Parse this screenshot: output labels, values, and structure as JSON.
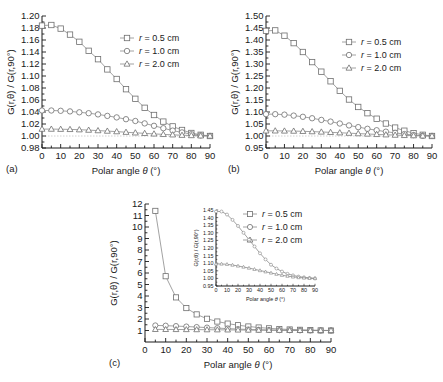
{
  "figure": {
    "panels": [
      {
        "id": "a",
        "label": "(a)",
        "xlabel_main": "Polar angle",
        "xlabel_sym": "θ",
        "xlabel_unit": "(°)",
        "ylabel": "G(r,θ) / G(r,90°)",
        "xticks": [
          0,
          10,
          20,
          30,
          40,
          50,
          60,
          70,
          80,
          90
        ],
        "yticks": [
          "0.98",
          "1.00",
          "1.02",
          "1.04",
          "1.06",
          "1.08",
          "1.10",
          "1.12",
          "1.14",
          "1.16",
          "1.18",
          "1.20"
        ],
        "legend": [
          {
            "marker": "square",
            "label": "r = 0.5 cm"
          },
          {
            "marker": "circle",
            "label": "r = 1.0 cm"
          },
          {
            "marker": "triangle",
            "label": "r = 2.0 cm"
          }
        ]
      },
      {
        "id": "b",
        "label": "(b)",
        "xlabel_main": "Polar angle",
        "xlabel_sym": "θ",
        "xlabel_unit": "(°)",
        "ylabel": "G(r,θ) / G(r,90°)",
        "xticks": [
          0,
          10,
          20,
          30,
          40,
          50,
          60,
          70,
          80,
          90
        ],
        "yticks": [
          "0.95",
          "1.00",
          "1.05",
          "1.10",
          "1.15",
          "1.20",
          "1.25",
          "1.30",
          "1.35",
          "1.40",
          "1.45",
          "1.50"
        ],
        "legend": [
          {
            "marker": "square",
            "label": "r = 0.5 cm"
          },
          {
            "marker": "circle",
            "label": "r = 1.0 cm"
          },
          {
            "marker": "triangle",
            "label": "r = 2.0 cm"
          }
        ]
      },
      {
        "id": "c",
        "label": "(c)",
        "xlabel_main": "Polar angle",
        "xlabel_sym": "θ",
        "xlabel_unit": "(°)",
        "ylabel": "G(r,θ) / G(r,90°)",
        "xticks": [
          0,
          10,
          20,
          30,
          40,
          50,
          60,
          70,
          80,
          90
        ],
        "yticks": [
          "1",
          "2",
          "3",
          "4",
          "5",
          "6",
          "7",
          "8",
          "9",
          "10",
          "11",
          "12"
        ],
        "legend": [
          {
            "marker": "square",
            "label": "r = 0.5 cm"
          },
          {
            "marker": "circle",
            "label": "r = 1.0 cm"
          },
          {
            "marker": "triangle",
            "label": "r = 2.0 cm"
          }
        ],
        "inset": {
          "xlabel_main": "Polar angle",
          "xlabel_sym": "θ",
          "xlabel_unit": "(°)",
          "ylabel": "G(r,θ) / G(r,90°)",
          "xticks": [
            0,
            10,
            20,
            30,
            40,
            50,
            60,
            70,
            80,
            90
          ],
          "yticks": [
            "0.95",
            "1.00",
            "1.05",
            "1.10",
            "1.15",
            "1.20",
            "1.25",
            "1.30",
            "1.35",
            "1.40",
            "1.45"
          ]
        }
      }
    ]
  },
  "chart_data": [
    {
      "type": "line",
      "panel": "a",
      "title": "",
      "xlabel": "Polar angle θ (°)",
      "ylabel": "G(r,θ) / G(r,90°)",
      "xlim": [
        0,
        90
      ],
      "ylim": [
        0.98,
        1.2
      ],
      "grid": false,
      "legend_position": "upper-right",
      "x": [
        0,
        5,
        10,
        15,
        20,
        25,
        30,
        35,
        40,
        45,
        50,
        55,
        60,
        65,
        70,
        75,
        80,
        85,
        90
      ],
      "series": [
        {
          "name": "r = 0.5 cm",
          "marker": "square",
          "values": [
            1.184,
            1.185,
            1.179,
            1.169,
            1.157,
            1.142,
            1.128,
            1.111,
            1.095,
            1.078,
            1.062,
            1.047,
            1.035,
            1.024,
            1.016,
            1.01,
            1.005,
            1.002,
            1.0
          ]
        },
        {
          "name": "r = 1.0 cm",
          "marker": "circle",
          "values": [
            1.0425,
            1.0425,
            1.042,
            1.041,
            1.0395,
            1.038,
            1.036,
            1.0335,
            1.031,
            1.028,
            1.025,
            1.021,
            1.017,
            1.013,
            1.009,
            1.006,
            1.003,
            1.001,
            1.0
          ]
        },
        {
          "name": "r = 2.0 cm",
          "marker": "triangle",
          "values": [
            1.0115,
            1.0115,
            1.0113,
            1.011,
            1.0105,
            1.0098,
            1.009,
            1.0082,
            1.0073,
            1.0063,
            1.0053,
            1.0044,
            1.0035,
            1.0027,
            1.002,
            1.0013,
            1.0008,
            1.0003,
            1.0
          ]
        }
      ]
    },
    {
      "type": "line",
      "panel": "b",
      "title": "",
      "xlabel": "Polar angle θ (°)",
      "ylabel": "G(r,θ) / G(r,90°)",
      "xlim": [
        0,
        90
      ],
      "ylim": [
        0.95,
        1.5
      ],
      "grid": false,
      "legend_position": "upper-right",
      "x": [
        0,
        5,
        10,
        15,
        20,
        25,
        30,
        35,
        40,
        45,
        50,
        55,
        60,
        65,
        70,
        75,
        80,
        85,
        90
      ],
      "series": [
        {
          "name": "r = 0.5 cm",
          "marker": "square",
          "values": [
            1.438,
            1.44,
            1.418,
            1.387,
            1.35,
            1.308,
            1.268,
            1.228,
            1.188,
            1.152,
            1.121,
            1.095,
            1.072,
            1.052,
            1.035,
            1.022,
            1.012,
            1.005,
            1.0
          ]
        },
        {
          "name": "r = 1.0 cm",
          "marker": "circle",
          "values": [
            1.091,
            1.091,
            1.089,
            1.085,
            1.08,
            1.074,
            1.067,
            1.06,
            1.052,
            1.044,
            1.037,
            1.03,
            1.024,
            1.018,
            1.013,
            1.008,
            1.004,
            1.001,
            1.0
          ]
        },
        {
          "name": "r = 2.0 cm",
          "marker": "triangle",
          "values": [
            1.0215,
            1.0215,
            1.021,
            1.0205,
            1.0195,
            1.0183,
            1.0168,
            1.0152,
            1.0135,
            1.0118,
            1.01,
            1.0083,
            1.0067,
            1.0052,
            1.0038,
            1.0025,
            1.0014,
            1.0006,
            1.0
          ]
        }
      ]
    },
    {
      "type": "line",
      "panel": "c",
      "title": "",
      "xlabel": "Polar angle θ (°)",
      "ylabel": "G(r,θ) / G(r,90°)",
      "xlim": [
        0,
        90
      ],
      "ylim": [
        0,
        12
      ],
      "grid": false,
      "legend_position": "upper-right",
      "x": [
        5,
        10,
        15,
        20,
        25,
        30,
        35,
        40,
        45,
        50,
        55,
        60,
        65,
        70,
        75,
        80,
        85,
        90
      ],
      "series": [
        {
          "name": "r = 0.5 cm",
          "marker": "square",
          "values": [
            11.4,
            5.72,
            3.88,
            2.95,
            2.4,
            2.02,
            1.78,
            1.6,
            1.46,
            1.35,
            1.26,
            1.19,
            1.13,
            1.09,
            1.06,
            1.03,
            1.01,
            1.0
          ]
        },
        {
          "name": "r = 1.0 cm",
          "marker": "circle",
          "values": [
            1.44,
            1.42,
            1.385,
            1.345,
            1.3,
            1.255,
            1.21,
            1.165,
            1.125,
            1.09,
            1.065,
            1.045,
            1.03,
            1.02,
            1.012,
            1.007,
            1.003,
            1.0
          ]
        },
        {
          "name": "r = 2.0 cm",
          "marker": "triangle",
          "values": [
            1.095,
            1.093,
            1.088,
            1.082,
            1.075,
            1.068,
            1.06,
            1.052,
            1.044,
            1.036,
            1.028,
            1.021,
            1.015,
            1.01,
            1.006,
            1.003,
            1.001,
            1.0
          ]
        }
      ]
    },
    {
      "type": "line",
      "panel": "c-inset",
      "title": "",
      "xlabel": "Polar angle θ (°)",
      "ylabel": "G(r,θ) / G(r,90°)",
      "xlim": [
        0,
        90
      ],
      "ylim": [
        0.95,
        1.45
      ],
      "grid": false,
      "legend_position": "none",
      "x": [
        0,
        5,
        10,
        15,
        20,
        25,
        30,
        35,
        40,
        45,
        50,
        55,
        60,
        65,
        70,
        75,
        80,
        85,
        90
      ],
      "series": [
        {
          "name": "r = 1.0 cm",
          "marker": "circle",
          "values": [
            1.44,
            1.44,
            1.42,
            1.385,
            1.345,
            1.3,
            1.255,
            1.21,
            1.165,
            1.125,
            1.09,
            1.065,
            1.045,
            1.03,
            1.02,
            1.012,
            1.007,
            1.003,
            1.0
          ]
        },
        {
          "name": "r = 2.0 cm",
          "marker": "triangle",
          "values": [
            1.095,
            1.095,
            1.093,
            1.088,
            1.082,
            1.075,
            1.068,
            1.06,
            1.052,
            1.044,
            1.036,
            1.028,
            1.021,
            1.015,
            1.01,
            1.006,
            1.003,
            1.001,
            1.0
          ]
        }
      ]
    }
  ]
}
